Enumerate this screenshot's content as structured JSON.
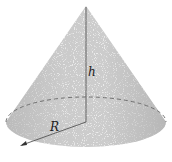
{
  "diagram": {
    "type": "cone",
    "labels": {
      "height": "h",
      "radius": "R"
    },
    "colors": {
      "surface_light": "#f2f2f2",
      "surface_dark": "#bdbdbd",
      "lines": "#555555"
    }
  }
}
